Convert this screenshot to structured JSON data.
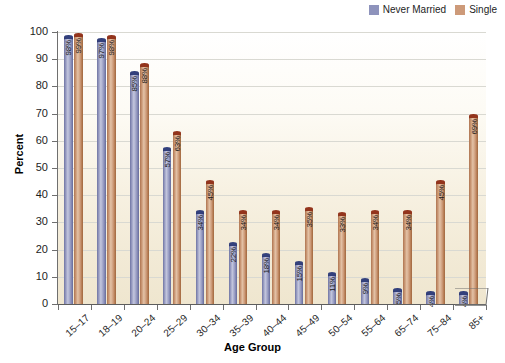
{
  "chart_data": {
    "type": "bar",
    "title": "",
    "xlabel": "Age Group",
    "ylabel": "Percent",
    "ylim": [
      0,
      100
    ],
    "yticks": [
      0,
      10,
      20,
      30,
      40,
      50,
      60,
      70,
      80,
      90,
      100
    ],
    "grid": true,
    "legend_position": "top-right",
    "value_suffix": "%",
    "categories": [
      "15–17",
      "18–19",
      "20–24",
      "25–29",
      "30–34",
      "35–39",
      "40–44",
      "45–49",
      "50–54",
      "55–64",
      "65–74",
      "75–84",
      "85+"
    ],
    "series": [
      {
        "name": "Never Married",
        "color": "#8e93bc",
        "values": [
          98,
          97,
          85,
          57,
          34,
          22,
          18,
          15,
          11,
          9,
          5,
          4,
          4
        ],
        "labels": [
          "98%",
          "97%",
          "85%",
          "57%",
          "34%",
          "22%",
          "18%",
          "15%",
          "11%",
          "9%",
          "5%",
          "4%",
          "4%"
        ]
      },
      {
        "name": "Single",
        "color": "#cd9a79",
        "values": [
          99,
          98,
          88,
          63,
          45,
          34,
          34,
          35,
          33,
          34,
          34,
          45,
          69
        ],
        "labels": [
          "99%",
          "98%",
          "88%",
          "63%",
          "45%",
          "34%",
          "34%",
          "35%",
          "33%",
          "34%",
          "34%",
          "45%",
          "69%"
        ]
      }
    ]
  },
  "legend": {
    "items": [
      {
        "label": "Never Married",
        "color": "#8e93bc"
      },
      {
        "label": "Single",
        "color": "#cd9a79"
      }
    ]
  }
}
